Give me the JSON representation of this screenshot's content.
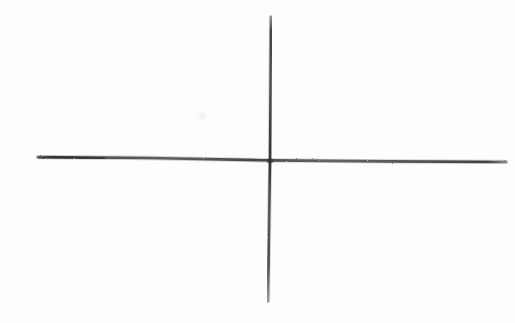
{
  "document": {
    "title": "Hand-drawn crossed axes sketch",
    "medium": "pencil on white paper",
    "background_color": "#fefefe",
    "width": 515,
    "height": 323
  },
  "drawing": {
    "description": "Two hand-drawn straight strokes crossing to form a plus / coordinate axes figure",
    "stroke_color": "#3a3a3a",
    "stroke_color_light": "#6d6d6d",
    "intersection": {
      "x": 270,
      "y": 161
    },
    "strokes": [
      {
        "name": "horizontal-axis-stroke",
        "orientation": "horizontal",
        "x1": 38,
        "y1": 157,
        "x2": 506,
        "y2": 162,
        "thickness": 3,
        "length": 468,
        "tilt_note": "slight downward slope left to right"
      },
      {
        "name": "vertical-axis-stroke",
        "orientation": "vertical",
        "x1": 271,
        "y1": 17,
        "x2": 268,
        "y2": 301,
        "thickness": 3,
        "length": 284,
        "tilt_note": "very slight lean, top drifts right of bottom"
      }
    ],
    "marks": [
      {
        "name": "faint-smudge-mark",
        "x": 202,
        "y": 116,
        "radius": 3,
        "opacity": 0.18,
        "color": "#9a9a9a"
      }
    ],
    "quadrants": [
      {
        "name": "quadrant-upper-left",
        "label": ""
      },
      {
        "name": "quadrant-upper-right",
        "label": ""
      },
      {
        "name": "quadrant-lower-left",
        "label": ""
      },
      {
        "name": "quadrant-lower-right",
        "label": ""
      }
    ]
  }
}
